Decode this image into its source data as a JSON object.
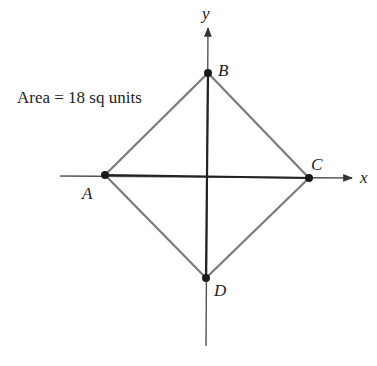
{
  "diagram": {
    "area_label": "Area = 18 sq units",
    "axes": {
      "x_label": "x",
      "y_label": "y"
    },
    "points": [
      {
        "name": "A",
        "label": "A"
      },
      {
        "name": "B",
        "label": "B"
      },
      {
        "name": "C",
        "label": "C"
      },
      {
        "name": "D",
        "label": "D"
      }
    ],
    "colors": {
      "axes": "#555555",
      "diagonals": "#222222",
      "square_edges": "#7a7a7a",
      "points": "#1a1a1a"
    }
  }
}
